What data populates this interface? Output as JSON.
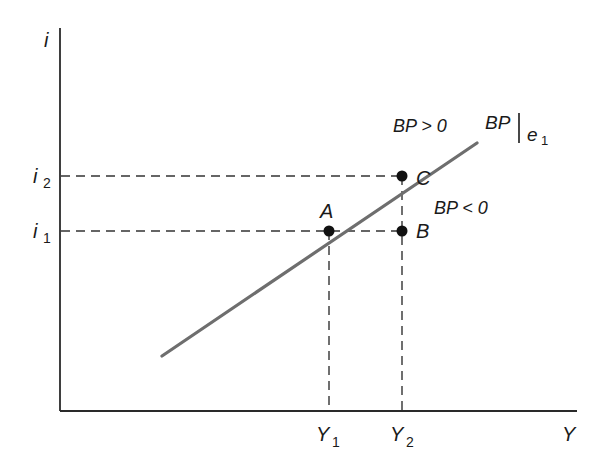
{
  "diagram": {
    "axes": {
      "y_label": "i",
      "x_label": "Y",
      "color": "#2a2a2a"
    },
    "curve": {
      "label": "BP",
      "label_subscript_var": "e",
      "label_subscript_num": "1",
      "color": "#6e6e6e"
    },
    "regions": {
      "above": "BP > 0",
      "below": "BP < 0"
    },
    "points": [
      {
        "name": "A",
        "x_ref": "Y1",
        "y_ref": "i1"
      },
      {
        "name": "B",
        "x_ref": "Y2",
        "y_ref": "i1"
      },
      {
        "name": "C",
        "x_ref": "Y2",
        "y_ref": "i2"
      }
    ],
    "y_ticks": [
      {
        "var": "i",
        "sub": "2"
      },
      {
        "var": "i",
        "sub": "1"
      }
    ],
    "x_ticks": [
      {
        "var": "Y",
        "sub": "1"
      },
      {
        "var": "Y",
        "sub": "2"
      }
    ],
    "dashed_color": "#333333",
    "point_color": "#111111"
  }
}
